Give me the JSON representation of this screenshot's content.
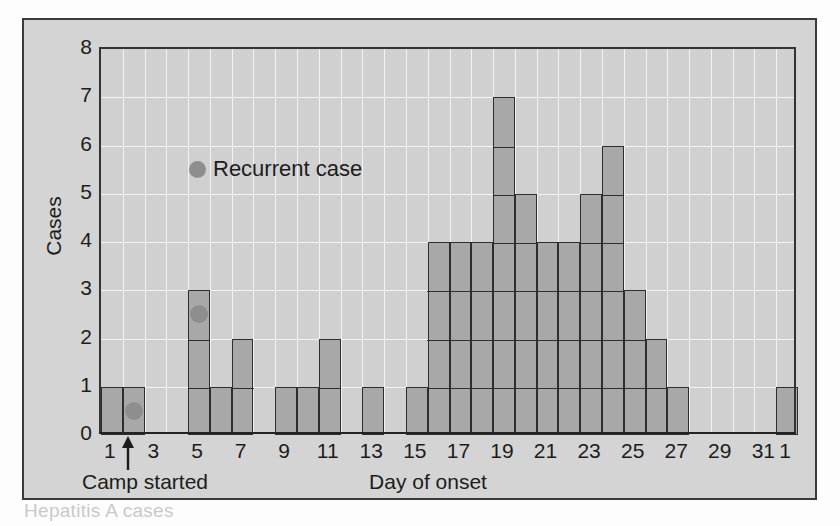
{
  "figure": {
    "caption_fragment": "Hepatitis A cases"
  },
  "legend": {
    "label": "Recurrent case",
    "marker": "recurrent-case-dot",
    "marker_color": "#8e8e8e"
  },
  "annotation": {
    "camp_started": "Camp started",
    "camp_started_day": 2,
    "arrow": "up-arrow-icon"
  },
  "colors": {
    "bar_fill": "#a8a8a8",
    "bar_stroke": "#2e2e2e",
    "panel_bg": "#d0d0d0",
    "frame_bg": "#d4d4d4",
    "gridline": "#f2f2f2"
  },
  "chart_data": {
    "type": "bar",
    "title": "",
    "xlabel": "Day of onset",
    "ylabel": "Cases",
    "ylim": [
      0,
      8
    ],
    "yticks": [
      0,
      1,
      2,
      3,
      4,
      5,
      6,
      7,
      8
    ],
    "xticks": [
      1,
      3,
      5,
      7,
      9,
      11,
      13,
      15,
      17,
      19,
      21,
      23,
      25,
      27,
      29,
      31,
      1
    ],
    "xtick_labels": [
      "1",
      "3",
      "5",
      "7",
      "9",
      "11",
      "13",
      "15",
      "17",
      "19",
      "21",
      "23",
      "25",
      "27",
      "29",
      "31",
      "1"
    ],
    "grid": true,
    "stacked_cells": true,
    "legend_position": "inside-upper-left",
    "categories": [
      1,
      2,
      3,
      4,
      5,
      6,
      7,
      8,
      9,
      10,
      11,
      12,
      13,
      14,
      15,
      16,
      17,
      18,
      19,
      20,
      21,
      22,
      23,
      24,
      25,
      26,
      27,
      28,
      29,
      30,
      31,
      32
    ],
    "values": [
      1,
      1,
      0,
      0,
      3,
      1,
      2,
      0,
      1,
      1,
      2,
      0,
      1,
      0,
      1,
      4,
      4,
      4,
      7,
      5,
      4,
      4,
      5,
      6,
      3,
      2,
      1,
      0,
      0,
      0,
      0,
      1
    ],
    "recurrent_cases": [
      {
        "day": 2,
        "case_index": 1
      },
      {
        "day": 5,
        "case_index": 3
      }
    ]
  }
}
